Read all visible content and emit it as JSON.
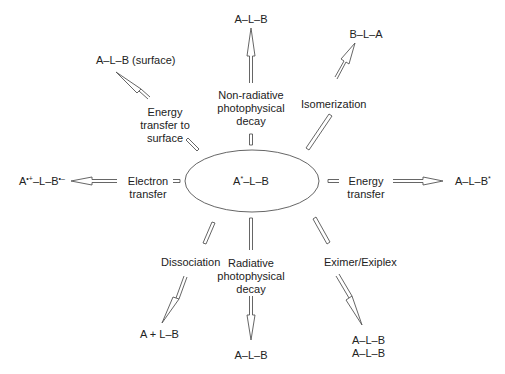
{
  "diagram": {
    "center": {
      "label": "A*–L–B",
      "text_main": "A",
      "text_sup": "*",
      "text_rest": "–L–B"
    },
    "processes": [
      {
        "id": "nonradiative",
        "label": "Non-radiative\nphotophysical\ndecay",
        "product": "A–L–B"
      },
      {
        "id": "isomerization",
        "label": "Isomerization",
        "product": "B–L–A"
      },
      {
        "id": "energy-transfer",
        "label": "Energy\ntransfer",
        "product_main": "A–L–B",
        "product_sup": "*"
      },
      {
        "id": "eximer",
        "label": "Eximer/Exiplex",
        "product": "A–L–B\nA–L–B"
      },
      {
        "id": "radiative",
        "label": "Radiative\nphotophysical\ndecay",
        "product": "A–L–B"
      },
      {
        "id": "dissociation",
        "label": "Dissociation",
        "product": "A + L–B"
      },
      {
        "id": "electron-transfer",
        "label": "Electron\ntransfer",
        "product_a": "A",
        "product_a_sup": "•+",
        "product_mid": "–L–B",
        "product_b_sup": "•–"
      },
      {
        "id": "surface",
        "label": "Energy\ntransfer to\nsurface",
        "product": "A–L–B (surface)"
      }
    ],
    "colors": {
      "line": "#555555",
      "text": "#222222",
      "background": "#ffffff"
    }
  }
}
